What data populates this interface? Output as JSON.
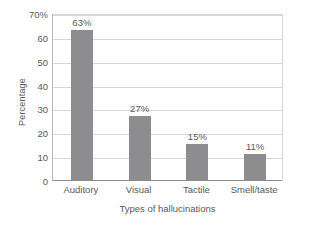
{
  "chart_data": {
    "type": "bar",
    "title": "",
    "subtitle": "",
    "xlabel": "Types of hallucinations",
    "ylabel": "Percentage",
    "categories": [
      "Auditory",
      "Visual",
      "Tactile",
      "Smell/taste"
    ],
    "values": [
      63,
      27,
      15,
      11
    ],
    "value_labels": [
      "63%",
      "27%",
      "15%",
      "11%"
    ],
    "ylim": [
      0,
      70
    ],
    "ytick_values": [
      0,
      10,
      20,
      30,
      40,
      50,
      60,
      70
    ],
    "ytick_labels": [
      "0",
      "10",
      "20",
      "30",
      "40",
      "50",
      "60",
      "70%"
    ],
    "grid": true,
    "grid_axis": "y",
    "legend": false,
    "legend_position": "none",
    "series": [
      {
        "name": "Percentage",
        "values": [
          63,
          27,
          15,
          11
        ],
        "color": "#8d8d8f"
      }
    ],
    "colors": {
      "bar": "#8d8d8f",
      "grid": "#d7d7d9",
      "axis": "#8e8e90",
      "text": "#59595b",
      "background": "#ffffff"
    }
  }
}
